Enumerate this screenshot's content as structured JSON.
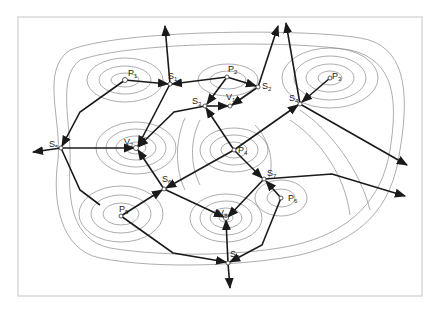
{
  "diagram": {
    "title": "",
    "colors": {
      "contour": "#8a8a8a",
      "edge": "#1a1a1a",
      "frame": "#cfcfcf",
      "background": "#ffffff"
    },
    "nodes": [
      {
        "id": "P1",
        "base": "P",
        "sub": "1",
        "x": 125,
        "y": 80,
        "type": "peak"
      },
      {
        "id": "P2",
        "base": "P",
        "sub": "2",
        "x": 227,
        "y": 77,
        "type": "peak"
      },
      {
        "id": "P3",
        "base": "P",
        "sub": "3",
        "x": 330,
        "y": 78,
        "type": "peak"
      },
      {
        "id": "P4",
        "base": "P",
        "sub": "4",
        "x": 234,
        "y": 150,
        "type": "peak"
      },
      {
        "id": "P5",
        "base": "P",
        "sub": "5",
        "x": 121,
        "y": 216,
        "type": "peak"
      },
      {
        "id": "P6",
        "base": "P",
        "sub": "6",
        "x": 281,
        "y": 198,
        "type": "peak"
      },
      {
        "id": "S1",
        "base": "S",
        "sub": "1",
        "x": 170,
        "y": 84,
        "type": "saddle"
      },
      {
        "id": "S2",
        "base": "S",
        "sub": "2",
        "x": 258,
        "y": 87,
        "type": "saddle"
      },
      {
        "id": "S3",
        "base": "S",
        "sub": "3",
        "x": 205,
        "y": 106,
        "type": "saddle"
      },
      {
        "id": "S4",
        "base": "S",
        "sub": "4",
        "x": 300,
        "y": 104,
        "type": "saddle"
      },
      {
        "id": "S5",
        "base": "S",
        "sub": "5",
        "x": 61,
        "y": 148,
        "type": "saddle"
      },
      {
        "id": "S6",
        "base": "S",
        "sub": "6",
        "x": 164,
        "y": 189,
        "type": "saddle"
      },
      {
        "id": "S7",
        "base": "S",
        "sub": "7",
        "x": 264,
        "y": 179,
        "type": "saddle"
      },
      {
        "id": "S8",
        "base": "S",
        "sub": "8",
        "x": 228,
        "y": 263,
        "type": "saddle"
      },
      {
        "id": "V1",
        "base": "V",
        "sub": "1",
        "x": 230,
        "y": 106,
        "type": "valley"
      },
      {
        "id": "V2",
        "base": "V",
        "sub": "2",
        "x": 136,
        "y": 148,
        "type": "valley"
      },
      {
        "id": "V3",
        "base": "V",
        "sub": "3",
        "x": 226,
        "y": 218,
        "type": "valley"
      }
    ],
    "edges": [
      {
        "from": "P1",
        "to": "S1"
      },
      {
        "from": "P1",
        "to": "S5"
      },
      {
        "from": "P2",
        "to": "S1"
      },
      {
        "from": "P2",
        "to": "S2"
      },
      {
        "from": "P2",
        "to": "S3"
      },
      {
        "from": "P3",
        "to": "S4"
      },
      {
        "from": "P4",
        "to": "S3"
      },
      {
        "from": "P4",
        "to": "S4"
      },
      {
        "from": "P4",
        "to": "S6"
      },
      {
        "from": "P4",
        "to": "S7"
      },
      {
        "from": "P5",
        "to": "S6"
      },
      {
        "from": "P5",
        "to": "S8"
      },
      {
        "from": "P6",
        "to": "S7"
      },
      {
        "from": "P6",
        "to": "S8"
      },
      {
        "from": "S1",
        "to": "V2"
      },
      {
        "from": "S2",
        "to": "V1"
      },
      {
        "from": "S3",
        "to": "V1"
      },
      {
        "from": "S3",
        "to": "V2"
      },
      {
        "from": "S5",
        "to": "V2"
      },
      {
        "from": "S6",
        "to": "V2"
      },
      {
        "from": "S6",
        "to": "V3"
      },
      {
        "from": "S7",
        "to": "V3"
      },
      {
        "from": "S8",
        "to": "V3"
      },
      {
        "from": "S1",
        "to": "out-top"
      },
      {
        "from": "S2",
        "to": "out-top"
      },
      {
        "from": "S4",
        "to": "out-top"
      },
      {
        "from": "S4",
        "to": "out-right"
      },
      {
        "from": "S5",
        "to": "out-left"
      },
      {
        "from": "S7",
        "to": "out-right"
      },
      {
        "from": "S8",
        "to": "out-bottom"
      }
    ]
  }
}
